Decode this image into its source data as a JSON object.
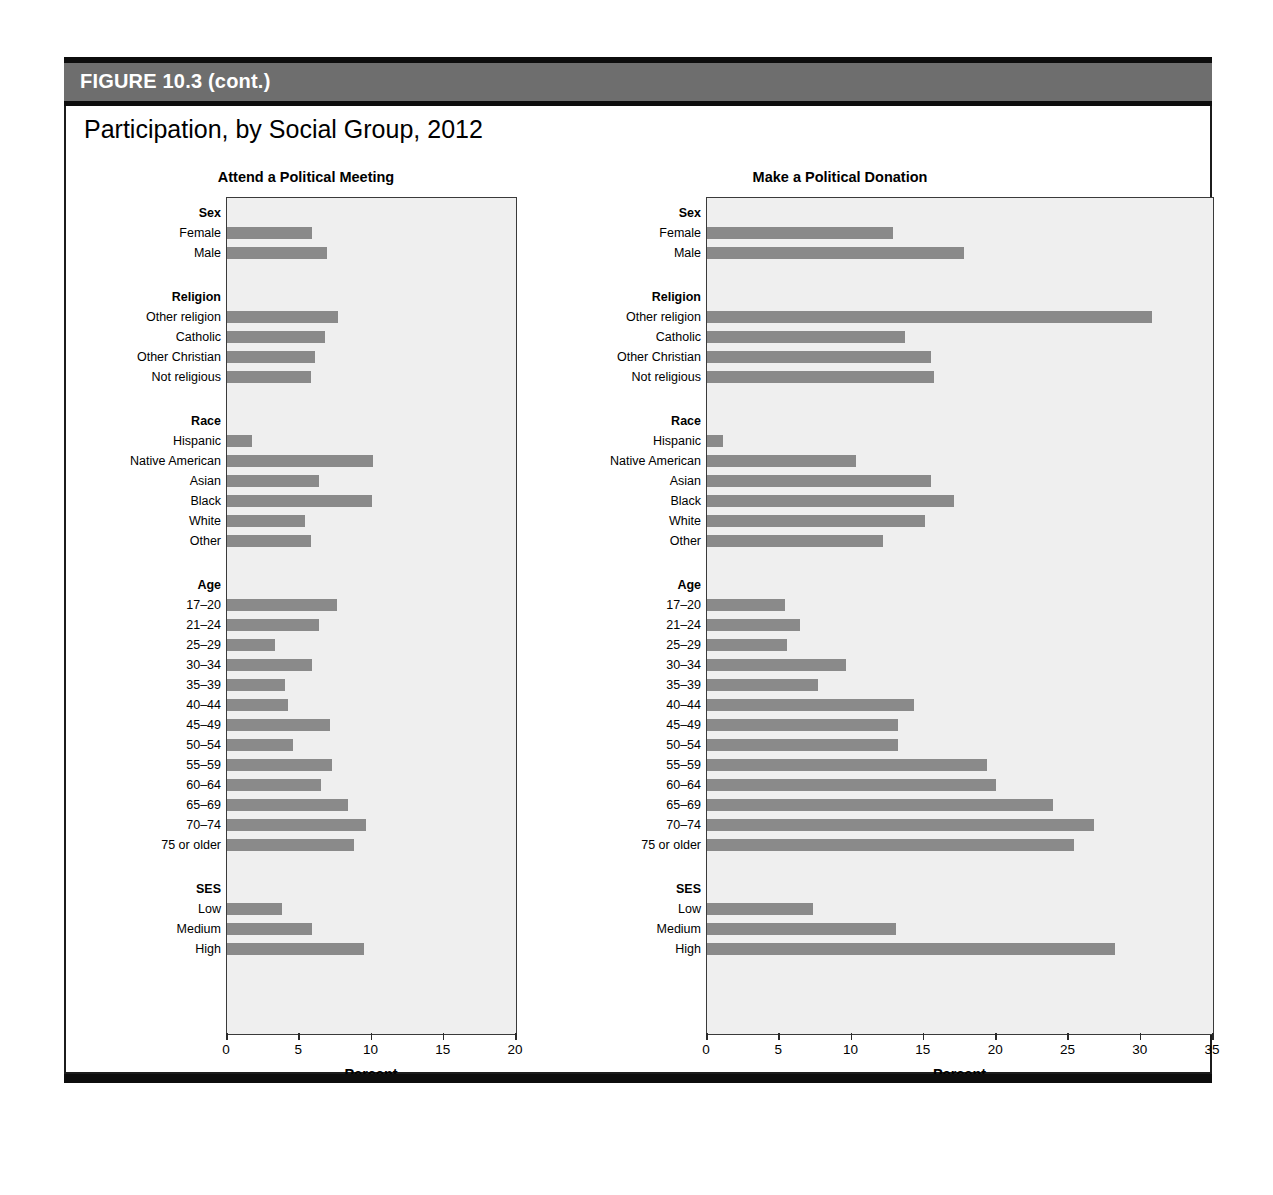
{
  "figure": {
    "header_label": "FIGURE 10.3 (cont.)",
    "subtitle": "Participation, by Social Group, 2012",
    "header_band_color": "#6e6e6e",
    "bar_color": "#8a8a8a",
    "plot_background_color": "#efefef"
  },
  "chart_data": [
    {
      "type": "bar",
      "orientation": "horizontal",
      "title": "Attend a Political Meeting",
      "xlabel": "Percent",
      "ylabel": "",
      "xlim": [
        0,
        20
      ],
      "xticks": [
        0,
        5,
        10,
        15,
        20
      ],
      "grid": false,
      "legend": "none",
      "groups": [
        {
          "name": "Sex",
          "categories": [
            "Female",
            "Male"
          ],
          "values": [
            5.9,
            6.9
          ]
        },
        {
          "name": "Religion",
          "categories": [
            "Other religion",
            "Catholic",
            "Other Christian",
            "Not religious"
          ],
          "values": [
            7.7,
            6.8,
            6.1,
            5.8
          ]
        },
        {
          "name": "Race",
          "categories": [
            "Hispanic",
            "Native American",
            "Asian",
            "Black",
            "White",
            "Other"
          ],
          "values": [
            1.7,
            10.1,
            6.4,
            10.0,
            5.4,
            5.8
          ]
        },
        {
          "name": "Age",
          "categories": [
            "17–20",
            "21–24",
            "25–29",
            "30–34",
            "35–39",
            "40–44",
            "45–49",
            "50–54",
            "55–59",
            "60–64",
            "65–69",
            "70–74",
            "75 or older"
          ],
          "values": [
            7.6,
            6.4,
            3.3,
            5.9,
            4.0,
            4.2,
            7.1,
            4.6,
            7.3,
            6.5,
            8.4,
            9.6,
            8.8
          ]
        },
        {
          "name": "SES",
          "categories": [
            "Low",
            "Medium",
            "High"
          ],
          "values": [
            3.8,
            5.9,
            9.5
          ]
        }
      ]
    },
    {
      "type": "bar",
      "orientation": "horizontal",
      "title": "Make a Political Donation",
      "xlabel": "Percent",
      "ylabel": "",
      "xlim": [
        0,
        35
      ],
      "xticks": [
        0,
        5,
        10,
        15,
        20,
        25,
        30,
        35
      ],
      "grid": false,
      "legend": "none",
      "groups": [
        {
          "name": "Sex",
          "categories": [
            "Female",
            "Male"
          ],
          "values": [
            12.9,
            17.8
          ]
        },
        {
          "name": "Religion",
          "categories": [
            "Other religion",
            "Catholic",
            "Other Christian",
            "Not religious"
          ],
          "values": [
            30.8,
            13.7,
            15.5,
            15.7
          ]
        },
        {
          "name": "Race",
          "categories": [
            "Hispanic",
            "Native American",
            "Asian",
            "Black",
            "White",
            "Other"
          ],
          "values": [
            1.1,
            10.3,
            15.5,
            17.1,
            15.1,
            12.2
          ]
        },
        {
          "name": "Age",
          "categories": [
            "17–20",
            "21–24",
            "25–29",
            "30–34",
            "35–39",
            "40–44",
            "45–49",
            "50–54",
            "55–59",
            "60–64",
            "65–69",
            "70–74",
            "75 or older"
          ],
          "values": [
            5.4,
            6.4,
            5.5,
            9.6,
            7.7,
            14.3,
            13.2,
            13.2,
            19.4,
            20.0,
            23.9,
            26.8,
            25.4
          ]
        },
        {
          "name": "SES",
          "categories": [
            "Low",
            "Medium",
            "High"
          ],
          "values": [
            7.3,
            13.1,
            28.2
          ]
        }
      ]
    }
  ]
}
